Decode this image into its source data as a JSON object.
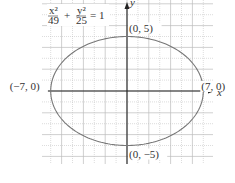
{
  "chart_data": {
    "type": "line",
    "title": "",
    "equation": {
      "x_num": "x²",
      "x_den": "49",
      "plus": "+",
      "y_num": "y²",
      "y_den": "25",
      "rhs": "= 1"
    },
    "xlabel": "x",
    "ylabel": "y",
    "xlim": [
      -8,
      8
    ],
    "ylim": [
      -7,
      8
    ],
    "grid": true,
    "curve": {
      "kind": "ellipse",
      "a": 7,
      "b": 5,
      "center": [
        0,
        0
      ]
    },
    "annotations": [
      {
        "text": "(−7, 0)",
        "x": -7,
        "y": 0
      },
      {
        "text": "(7, 0)",
        "x": 7,
        "y": 0
      },
      {
        "text": "(0, 5)",
        "x": 0,
        "y": 5
      },
      {
        "text": "(0, −5)",
        "x": 0,
        "y": -5
      }
    ],
    "colors": {
      "curve": "#777777",
      "axis": "#222222",
      "grid": "#bbbbbb"
    }
  }
}
